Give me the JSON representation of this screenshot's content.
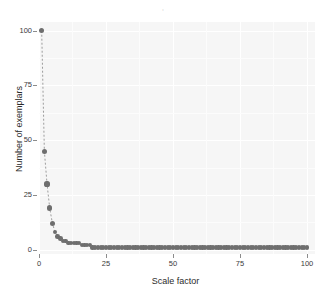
{
  "figure": {
    "title": ",",
    "background": "#ffffff",
    "panel_background": "#f6f6f6",
    "grid_color": "#ffffff",
    "point_color": "#6e6e6e",
    "line_color": "#9a9a9a"
  },
  "chart_data": {
    "type": "scatter",
    "title": ",",
    "xlabel": "Scale factor",
    "ylabel": "Number of exemplars",
    "xlim": [
      0,
      103
    ],
    "ylim": [
      -2,
      104
    ],
    "xticks": [
      0,
      25,
      50,
      75,
      100
    ],
    "yticks": [
      0,
      25,
      50,
      75,
      100
    ],
    "xtick_labels": [
      "0",
      "25",
      "50",
      "75",
      "100"
    ],
    "ytick_labels": [
      "0",
      "25",
      "50",
      "75",
      "100"
    ],
    "grid": true,
    "legend": "none",
    "marker": "filled-circle",
    "line_style": "dashed",
    "x": [
      1,
      2,
      3,
      4,
      5,
      6,
      7,
      8,
      9,
      10,
      11,
      12,
      13,
      14,
      15,
      16,
      17,
      18,
      19,
      20,
      21,
      22,
      23,
      24,
      25,
      26,
      27,
      28,
      29,
      30,
      31,
      32,
      33,
      34,
      35,
      36,
      37,
      38,
      39,
      40,
      41,
      42,
      43,
      44,
      45,
      46,
      47,
      48,
      49,
      50,
      51,
      52,
      53,
      54,
      55,
      56,
      57,
      58,
      59,
      60,
      61,
      62,
      63,
      64,
      65,
      66,
      67,
      68,
      69,
      70,
      71,
      72,
      73,
      74,
      75,
      76,
      77,
      78,
      79,
      80,
      81,
      82,
      83,
      84,
      85,
      86,
      87,
      88,
      89,
      90,
      91,
      92,
      93,
      94,
      95,
      96,
      97,
      98,
      99,
      100
    ],
    "y": [
      100,
      45,
      30,
      19,
      12,
      8,
      6,
      5,
      4,
      4,
      3,
      3,
      3,
      3,
      3,
      2,
      2,
      2,
      2,
      1,
      1,
      1,
      1,
      1,
      1,
      1,
      1,
      1,
      1,
      1,
      1,
      1,
      1,
      1,
      1,
      1,
      1,
      1,
      1,
      1,
      1,
      1,
      1,
      1,
      1,
      1,
      1,
      1,
      1,
      1,
      1,
      1,
      1,
      1,
      1,
      1,
      1,
      1,
      1,
      1,
      1,
      1,
      1,
      1,
      1,
      1,
      1,
      1,
      1,
      1,
      1,
      1,
      1,
      1,
      1,
      1,
      1,
      1,
      1,
      1,
      1,
      1,
      1,
      1,
      1,
      1,
      1,
      1,
      1,
      1,
      1,
      1,
      1,
      1,
      1,
      1,
      1,
      1,
      1,
      1,
      1,
      1
    ]
  }
}
